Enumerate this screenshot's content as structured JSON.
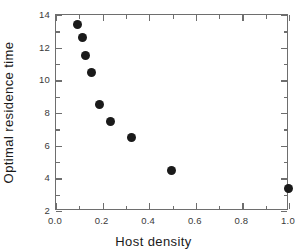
{
  "chart_data": {
    "type": "scatter",
    "title": "",
    "xlabel": "Host density",
    "ylabel": "Optimal residence time",
    "xlim": [
      0.0,
      1.0
    ],
    "ylim": [
      2,
      14
    ],
    "grid": false,
    "legend": null,
    "marker": {
      "shape": "circle",
      "color": "#1a1a1a",
      "size_px": 9
    },
    "x_major_ticks": [
      0.0,
      0.2,
      0.4,
      0.6,
      0.8,
      1.0
    ],
    "x_major_tick_labels": [
      "0.0",
      "0.2",
      "0.4",
      "0.6",
      "0.8",
      "1.0"
    ],
    "x_minor_ticks": [
      0.1,
      0.3,
      0.5,
      0.7,
      0.9
    ],
    "y_major_ticks": [
      2,
      4,
      6,
      8,
      10,
      12,
      14
    ],
    "y_major_tick_labels": [
      "2",
      "4",
      "6",
      "8",
      "10",
      "12",
      "14"
    ],
    "y_minor_ticks": [
      3,
      5,
      7,
      9,
      11,
      13
    ],
    "x": [
      0.093,
      0.115,
      0.126,
      0.153,
      0.186,
      0.233,
      0.325,
      0.494,
      0.998
    ],
    "y": [
      13.43,
      12.61,
      11.53,
      10.51,
      8.49,
      7.46,
      6.52,
      4.48,
      3.37
    ],
    "points": [
      {
        "x": 0.093,
        "y": 13.43
      },
      {
        "x": 0.115,
        "y": 12.61
      },
      {
        "x": 0.126,
        "y": 11.53
      },
      {
        "x": 0.153,
        "y": 10.51
      },
      {
        "x": 0.186,
        "y": 8.49
      },
      {
        "x": 0.233,
        "y": 7.46
      },
      {
        "x": 0.325,
        "y": 6.52
      },
      {
        "x": 0.494,
        "y": 4.48
      },
      {
        "x": 0.998,
        "y": 3.37
      }
    ]
  },
  "axes": {
    "frame_color": "#6e6e6e",
    "tick_label_color": "#3a3a3a",
    "axis_label_color": "#1a1a1a"
  }
}
